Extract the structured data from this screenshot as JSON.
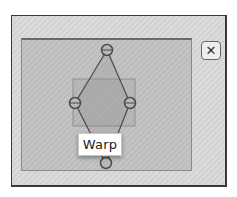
{
  "panel": {
    "close_icon": "close-icon",
    "close_glyph": "✕"
  },
  "warp": {
    "tooltip_label": "Warp",
    "handles": [
      {
        "name": "top",
        "x": 107,
        "y": 50
      },
      {
        "name": "left",
        "x": 75,
        "y": 103
      },
      {
        "name": "right",
        "x": 130,
        "y": 103
      },
      {
        "name": "bottom",
        "x": 106,
        "y": 164
      }
    ],
    "bounding_rect": {
      "x": 73,
      "y": 79,
      "width": 62,
      "height": 47
    }
  },
  "colors": {
    "panel_bg": "#d8d8d8",
    "canvas_bg": "#c0c0c0",
    "line": "#4a4a4a",
    "rect_stroke": "#8f8f8f"
  }
}
